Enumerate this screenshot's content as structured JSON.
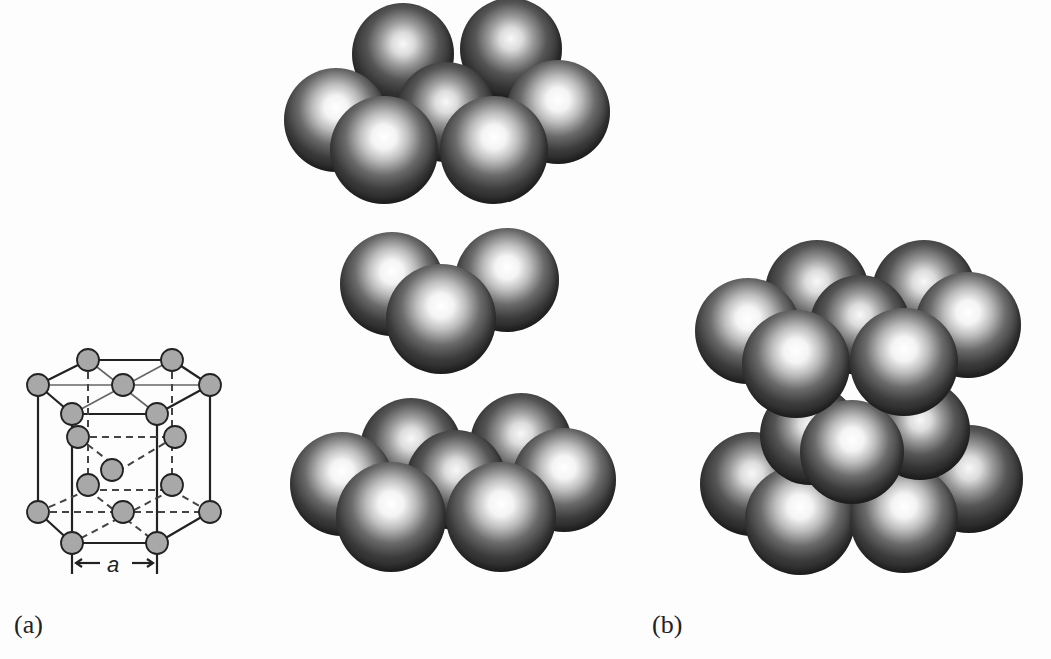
{
  "figure": {
    "panels": [
      {
        "id": "a",
        "label": "(a)",
        "unit_cell": {
          "dimension_label": "a",
          "description": "HCP unit cell ball-and-stick drawing with hexagonal top and bottom faces and three interior atoms"
        },
        "layers": [
          {
            "name": "top-layer",
            "atom_count": 7
          },
          {
            "name": "middle-layer",
            "atom_count": 3
          },
          {
            "name": "bottom-layer",
            "atom_count": 7
          }
        ]
      },
      {
        "id": "b",
        "label": "(b)",
        "description": "Assembled stacked close-packed layers (ABA stacking)"
      }
    ],
    "colors": {
      "background": "#fdfdfd",
      "atom_fill_cell": "#a8a8a8",
      "line": "#222222",
      "sphere_dark": "#262626",
      "sphere_highlight": "#ffffff"
    }
  }
}
